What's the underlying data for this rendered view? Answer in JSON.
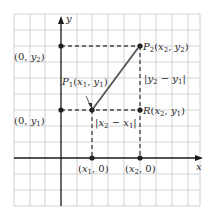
{
  "diagram": {
    "type": "coordinate-plane-distance",
    "axes": {
      "x_label": "x",
      "y_label": "y"
    },
    "points": {
      "P1": {
        "name": "P",
        "sub": "1",
        "coords_label": "(x1, y1)"
      },
      "P2": {
        "name": "P",
        "sub": "2",
        "coords_label": "(x2, y2)"
      },
      "R": {
        "name": "R",
        "coords_label": "(x2, y1)"
      },
      "y2_axis": {
        "label": "(0, y2)"
      },
      "y1_axis": {
        "label": "(0, y1)"
      },
      "x1_axis": {
        "label": "(x1, 0)"
      },
      "x2_axis": {
        "label": "(x2, 0)"
      }
    },
    "measures": {
      "vertical": "|y2 − y1|",
      "horizontal": "|x2 − x1|"
    },
    "colors": {
      "grid": "#c8c8c8",
      "axis": "#1a1a1a",
      "line": "#555555",
      "dashed": "#444444",
      "point": "#222222"
    }
  }
}
